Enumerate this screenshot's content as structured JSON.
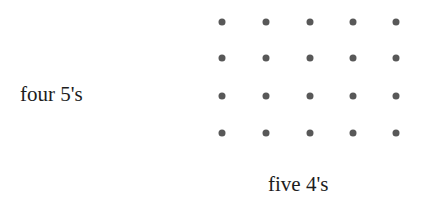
{
  "figure": {
    "background_color": "#ffffff",
    "dot_color": "#585858",
    "arrow_color": "#3a3a3a",
    "text_color": "#1d1d1d",
    "rows": 4,
    "columns": 5,
    "row_label": "four 5's",
    "column_label": "five 4's",
    "row_arrow_icon": "arrow-right-icon",
    "column_arrow_icon": "arrow-up-icon",
    "dot_icon": "dot-icon",
    "grid": {
      "column_x": [
        222,
        266,
        310,
        353,
        396
      ],
      "row_y": [
        22,
        58,
        96,
        133
      ],
      "row_arrow_x": 178,
      "column_arrow_y": 142
    },
    "dot_rows": [
      [
        1,
        1,
        1,
        1,
        1
      ],
      [
        1,
        1,
        1,
        1,
        1
      ],
      [
        1,
        1,
        1,
        1,
        1
      ],
      [
        1,
        1,
        1,
        1,
        1
      ]
    ]
  }
}
